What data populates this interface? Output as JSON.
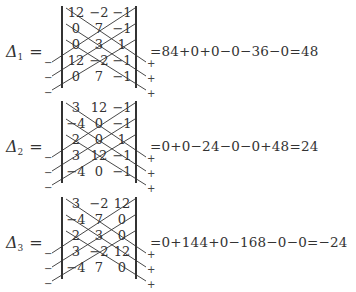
{
  "determinants": [
    {
      "label": "Δ",
      "subscript": "1",
      "equals": "=",
      "rows": [
        [
          "12",
          "-2",
          "-1"
        ],
        [
          "0",
          "7",
          "-1"
        ],
        [
          "0",
          "3",
          "1"
        ],
        [
          "12",
          "-2",
          "-1"
        ],
        [
          "0",
          "7",
          "-1"
        ]
      ],
      "left_signs": [
        "−",
        "−",
        "−"
      ],
      "right_signs": [
        "+",
        "+",
        "+"
      ],
      "expansion": "=84+0+0−0−36−0=48"
    },
    {
      "label": "Δ",
      "subscript": "2",
      "equals": "=",
      "rows": [
        [
          "3",
          "12",
          "-1"
        ],
        [
          "-4",
          "0",
          "-1"
        ],
        [
          "2",
          "0",
          "1"
        ],
        [
          "3",
          "12",
          "-1"
        ],
        [
          "-4",
          "0",
          "-1"
        ]
      ],
      "left_signs": [
        "−",
        "−",
        "−"
      ],
      "right_signs": [
        "+",
        "+",
        "+"
      ],
      "expansion": "=0+0−24−0−0+48=24"
    },
    {
      "label": "Δ",
      "subscript": "3",
      "equals": "=",
      "rows": [
        [
          "3",
          "-2",
          "12"
        ],
        [
          "-4",
          "7",
          "0"
        ],
        [
          "2",
          "3",
          "0"
        ],
        [
          "3",
          "-2",
          "12"
        ],
        [
          "-4",
          "7",
          "0"
        ]
      ],
      "left_signs": [
        "−",
        "−",
        "−"
      ],
      "right_signs": [
        "+",
        "+",
        "+"
      ],
      "expansion": "=0+144+0−168−0−0=−24"
    }
  ]
}
